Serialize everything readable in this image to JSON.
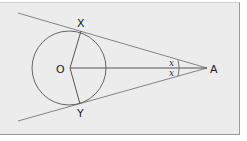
{
  "diagram": {
    "type": "geometry-tangents-from-external-point",
    "points": {
      "O": {
        "label": "O"
      },
      "X": {
        "label": "X"
      },
      "Y": {
        "label": "Y"
      },
      "A": {
        "label": "A"
      }
    },
    "angle_labels": {
      "upper": "x",
      "lower": "x"
    },
    "colors": {
      "background": "#ececec",
      "stroke": "#6b6b6b",
      "text": "#222222"
    }
  }
}
